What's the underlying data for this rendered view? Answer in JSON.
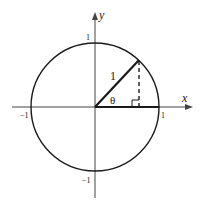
{
  "diagram": {
    "axes": {
      "x_label": "x",
      "y_label": "y",
      "tick_labels": {
        "x_neg": "−1",
        "x_pos": "1",
        "y_pos": "1",
        "y_neg": "−1"
      }
    },
    "triangle": {
      "hypotenuse_label": "1",
      "angle_label": "θ"
    },
    "colors": {
      "stroke": "#1a1a1a",
      "axis": "#444444",
      "background": "#ffffff"
    }
  }
}
